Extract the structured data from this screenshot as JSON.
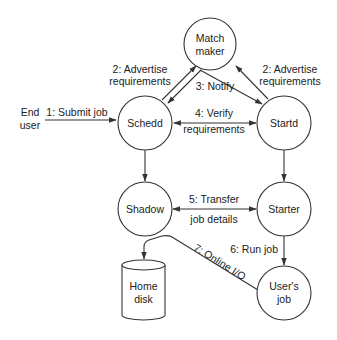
{
  "diagram": {
    "nodes": {
      "matchmaker": {
        "line1": "Match",
        "line2": "maker"
      },
      "schedd": {
        "label": "Schedd"
      },
      "startd": {
        "label": "Startd"
      },
      "shadow": {
        "label": "Shadow"
      },
      "starter": {
        "label": "Starter"
      },
      "users_job": {
        "line1": "User's",
        "line2": "job"
      },
      "home_disk": {
        "line1": "Home",
        "line2": "disk"
      },
      "end_user": {
        "line1": "End",
        "line2": "user"
      }
    },
    "edges": {
      "submit_job": {
        "label": "1: Submit job"
      },
      "advertise_left": {
        "line1": "2: Advertise",
        "line2": "requirements"
      },
      "advertise_right": {
        "line1": "2: Advertise",
        "line2": "requirements"
      },
      "notify": {
        "label": "3: Notify"
      },
      "verify": {
        "line1": "4: Verify",
        "line2": "requirements"
      },
      "transfer": {
        "line1": "5: Transfer",
        "line2": "job details"
      },
      "run_job": {
        "label": "6: Run job"
      },
      "online_io": {
        "label": "7: Online I/O"
      }
    }
  }
}
